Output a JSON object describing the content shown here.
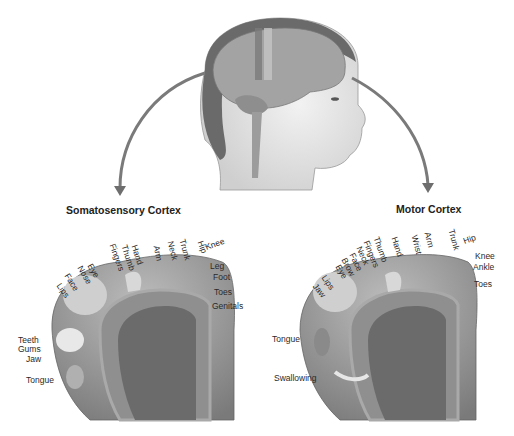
{
  "diagram": {
    "head": {
      "label": "head-with-brain"
    },
    "somatosensory": {
      "title": "Somatosensory Cortex",
      "labels": [
        "Genitals",
        "Toes",
        "Foot",
        "Leg",
        "Knee",
        "Hip",
        "Trunk",
        "Neck",
        "Arm",
        "Hand",
        "Thumb",
        "Fingers",
        "Eye",
        "Nose",
        "Face",
        "Lips",
        "Teeth",
        "Gums",
        "Jaw",
        "Tongue"
      ]
    },
    "motor": {
      "title": "Motor Cortex",
      "labels": [
        "Toes",
        "Ankle",
        "Knee",
        "Hip",
        "Trunk",
        "Arm",
        "Wrist",
        "Hand",
        "Thumb",
        "Fingers",
        "Neck",
        "Face",
        "Brow",
        "Eye",
        "Lips",
        "Jaw",
        "Tongue",
        "Swallowing"
      ]
    },
    "colors": {
      "arrow": "#777777",
      "cortex": "#9a9a9a",
      "cortex_dark": "#6e6e6e",
      "skin": "#e4e4e4",
      "brain": "#a8a8a8"
    }
  }
}
